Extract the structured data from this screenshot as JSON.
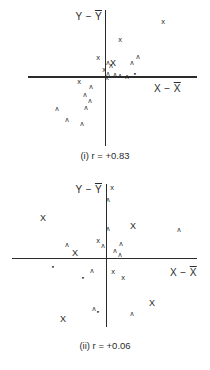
{
  "page": {
    "background": "#ffffff",
    "ink": "#262626"
  },
  "glyphs": {
    "x": "x",
    "X": "X",
    "caret": "ʌ",
    "dot": "▪"
  },
  "charts": [
    {
      "id": "i",
      "caption": "(i) r = +0.83",
      "ylabel_prefix": "Y −",
      "ylabel_bar": "Y",
      "xlabel_prefix": "X −",
      "xlabel_bar": "X",
      "points": [
        {
          "x": 163,
          "y": 22,
          "g": "x"
        },
        {
          "x": 120,
          "y": 40,
          "g": "x"
        },
        {
          "x": 138,
          "y": 56,
          "g": "caret"
        },
        {
          "x": 132,
          "y": 62,
          "g": "caret"
        },
        {
          "x": 98,
          "y": 58,
          "g": "x"
        },
        {
          "x": 108,
          "y": 62,
          "g": "caret"
        },
        {
          "x": 113,
          "y": 63,
          "g": "X"
        },
        {
          "x": 111,
          "y": 65,
          "g": "caret"
        },
        {
          "x": 104,
          "y": 70,
          "g": "x"
        },
        {
          "x": 108,
          "y": 73,
          "g": "caret"
        },
        {
          "x": 115,
          "y": 74,
          "g": "caret"
        },
        {
          "x": 120,
          "y": 75,
          "g": "caret"
        },
        {
          "x": 127,
          "y": 76,
          "g": "caret"
        },
        {
          "x": 135,
          "y": 74,
          "g": "dot"
        },
        {
          "x": 107,
          "y": 78,
          "g": "x"
        },
        {
          "x": 79,
          "y": 82,
          "g": "x"
        },
        {
          "x": 91,
          "y": 86,
          "g": "caret"
        },
        {
          "x": 85,
          "y": 94,
          "g": "caret"
        },
        {
          "x": 90,
          "y": 100,
          "g": "caret"
        },
        {
          "x": 86,
          "y": 107,
          "g": "caret"
        },
        {
          "x": 57,
          "y": 108,
          "g": "caret"
        },
        {
          "x": 67,
          "y": 119,
          "g": "caret"
        },
        {
          "x": 82,
          "y": 123,
          "g": "caret"
        }
      ]
    },
    {
      "id": "ii",
      "caption": "(ii) r = +0.06",
      "ylabel_prefix": "Y −",
      "ylabel_bar": "Y",
      "xlabel_prefix": "X −",
      "xlabel_bar": "X",
      "points": [
        {
          "x": 43,
          "y": 218,
          "g": "X"
        },
        {
          "x": 67,
          "y": 244,
          "g": "caret"
        },
        {
          "x": 75,
          "y": 253,
          "g": "X"
        },
        {
          "x": 98,
          "y": 241,
          "g": "x"
        },
        {
          "x": 103,
          "y": 245,
          "g": "caret"
        },
        {
          "x": 112,
          "y": 188,
          "g": "x"
        },
        {
          "x": 108,
          "y": 199,
          "g": "caret"
        },
        {
          "x": 108,
          "y": 228,
          "g": "caret"
        },
        {
          "x": 121,
          "y": 243,
          "g": "caret"
        },
        {
          "x": 133,
          "y": 226,
          "g": "X"
        },
        {
          "x": 179,
          "y": 229,
          "g": "caret"
        },
        {
          "x": 115,
          "y": 250,
          "g": "caret"
        },
        {
          "x": 120,
          "y": 254,
          "g": "caret"
        },
        {
          "x": 53,
          "y": 267,
          "g": "dot"
        },
        {
          "x": 83,
          "y": 278,
          "g": "dot"
        },
        {
          "x": 92,
          "y": 270,
          "g": "caret"
        },
        {
          "x": 94,
          "y": 308,
          "g": "caret"
        },
        {
          "x": 98,
          "y": 312,
          "g": "dot"
        },
        {
          "x": 63,
          "y": 319,
          "g": "X"
        },
        {
          "x": 113,
          "y": 272,
          "g": "x"
        },
        {
          "x": 123,
          "y": 278,
          "g": "x"
        },
        {
          "x": 152,
          "y": 303,
          "g": "X"
        },
        {
          "x": 132,
          "y": 313,
          "g": "caret"
        }
      ]
    }
  ],
  "chart_data": [
    {
      "type": "scatter",
      "title": "(i) r = +0.83",
      "xlabel": "X − X̄",
      "ylabel": "Y − Ȳ",
      "legend": "none",
      "grid": false,
      "axes_through_origin": true,
      "series": [
        {
          "name": "deviations (x−x̄, y−ȳ)",
          "points": [
            [
              57,
              55
            ],
            [
              14,
              37
            ],
            [
              32,
              21
            ],
            [
              26,
              15
            ],
            [
              -8,
              19
            ],
            [
              2,
              15
            ],
            [
              7,
              14
            ],
            [
              5,
              12
            ],
            [
              -2,
              7
            ],
            [
              2,
              4
            ],
            [
              9,
              3
            ],
            [
              14,
              2
            ],
            [
              21,
              1
            ],
            [
              29,
              3
            ],
            [
              1,
              -1
            ],
            [
              -27,
              -5
            ],
            [
              -15,
              -9
            ],
            [
              -21,
              -17
            ],
            [
              -16,
              -23
            ],
            [
              -20,
              -30
            ],
            [
              -49,
              -31
            ],
            [
              -39,
              -42
            ],
            [
              -24,
              -46
            ]
          ]
        }
      ],
      "xlim": [
        -70,
        75
      ],
      "ylim": [
        -55,
        60
      ]
    },
    {
      "type": "scatter",
      "title": "(ii) r = +0.06",
      "xlabel": "X − X̄",
      "ylabel": "Y − Ȳ",
      "legend": "none",
      "grid": false,
      "axes_through_origin": true,
      "series": [
        {
          "name": "deviations (x−x̄, y−ȳ)",
          "points": [
            [
              -64,
              41
            ],
            [
              -40,
              15
            ],
            [
              -32,
              6
            ],
            [
              -9,
              18
            ],
            [
              -4,
              14
            ],
            [
              5,
              71
            ],
            [
              1,
              60
            ],
            [
              1,
              31
            ],
            [
              14,
              16
            ],
            [
              26,
              33
            ],
            [
              72,
              30
            ],
            [
              8,
              9
            ],
            [
              13,
              5
            ],
            [
              -54,
              -8
            ],
            [
              -24,
              -19
            ],
            [
              -15,
              -11
            ],
            [
              -13,
              -49
            ],
            [
              -9,
              -53
            ],
            [
              -44,
              -60
            ],
            [
              6,
              -13
            ],
            [
              16,
              -19
            ],
            [
              45,
              -44
            ],
            [
              25,
              -54
            ]
          ]
        }
      ],
      "xlim": [
        -95,
        90
      ],
      "ylim": [
        -70,
        75
      ]
    }
  ]
}
